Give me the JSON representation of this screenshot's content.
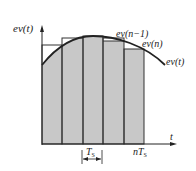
{
  "diagram": {
    "title": "",
    "y_axis_label": "ev(t)",
    "x_axis_label": "t",
    "curve_label": "ev(t)",
    "label_prev_sample": "ev(n−1)",
    "label_current_sample": "ev(n)",
    "sampling_period_label": "T",
    "sampling_period_subscript": "S",
    "end_time_label_prefix": "nT",
    "end_time_label_subscript": "S",
    "bar_count": 5,
    "colors": {
      "bar_fill": "#c8c8c8",
      "line": "#222222",
      "background": "#ffffff"
    }
  }
}
